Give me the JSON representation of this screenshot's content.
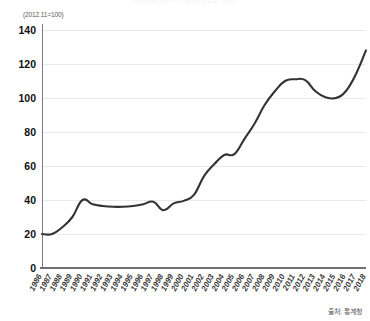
{
  "title": "주택매매가격 종합지수 추이",
  "unit_note": "(2012.11=100)",
  "source_note": "출처: 통계청",
  "colors": {
    "line": "#333333",
    "grid": "#e9e9ec",
    "axis": "#7a7a80",
    "text": "#111111"
  },
  "chart_data": {
    "type": "line",
    "title": "주택매매가격 종합지수 추이",
    "subtitle": "(2012.11=100)",
    "xlabel": "",
    "ylabel": "",
    "ylim": [
      0,
      140
    ],
    "yticks": [
      0,
      20,
      40,
      60,
      80,
      100,
      120,
      140
    ],
    "ytick_labels": [
      "0",
      "20",
      "40",
      "60",
      "80",
      "100",
      "120",
      "140"
    ],
    "grid": true,
    "legend": false,
    "legend_position": "none",
    "categories": [
      "1986",
      "1987",
      "1988",
      "1989",
      "1990",
      "1991",
      "1992",
      "1993",
      "1994",
      "1995",
      "1996",
      "1997",
      "1998",
      "1999",
      "2000",
      "2001",
      "2002",
      "2003",
      "2004",
      "2005",
      "2006",
      "2007",
      "2008",
      "2009",
      "2010",
      "2011",
      "2012",
      "2013",
      "2014",
      "2015",
      "2016",
      "2017",
      "2018"
    ],
    "values": [
      20,
      20,
      24,
      30,
      40,
      37.5,
      36.5,
      36,
      36,
      36.5,
      37.5,
      39,
      34,
      38,
      39.5,
      43,
      54,
      61,
      66.5,
      67,
      76,
      85,
      96,
      104,
      110,
      111,
      110.5,
      104,
      100.5,
      100,
      104,
      114,
      128
    ],
    "annotations": [],
    "source": "출처: 통계청"
  }
}
